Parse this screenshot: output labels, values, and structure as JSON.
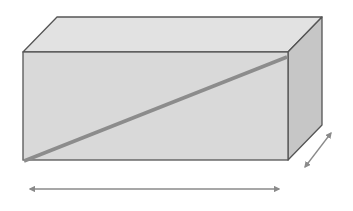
{
  "diagram": {
    "colors": {
      "background": "#ffffff",
      "front_face": "#d9d9d9",
      "top_face": "#e2e2e2",
      "side_face": "#c6c6c6",
      "edge": "#555555",
      "diagonal": "#8c8c8c",
      "arrow": "#8a8a8a"
    },
    "box": {
      "front": {
        "x1": 23,
        "y1": 52,
        "x2": 288,
        "y2": 160
      },
      "depth_offset": {
        "dx": 34,
        "dy": -35
      }
    },
    "diagonal": {
      "x1": 24,
      "y1": 161,
      "x2": 287,
      "y2": 57
    },
    "length_arrow": {
      "x1": 24,
      "y1": 189,
      "x2": 285,
      "y2": 189,
      "label": ""
    },
    "depth_arrow": {
      "x1": 302,
      "y1": 172,
      "x2": 334,
      "y2": 128,
      "label": ""
    }
  }
}
